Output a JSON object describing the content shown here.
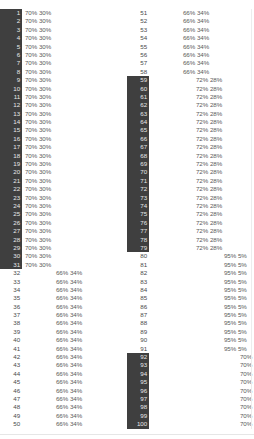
{
  "table": {
    "total_rows": 100,
    "left_pane_label": "rows-1-50",
    "right_pane_label": "rows-51-100",
    "highlight_color": "#3f3f3f",
    "highlight_text_color": "#e8e8e8",
    "text_color": "#5a5a5a",
    "background_color": "#ffffff",
    "columns": [
      "row_number",
      "major_percent",
      "minor_percent"
    ],
    "groups": [
      {
        "name": "group-70-30-a",
        "start": 1,
        "end": 31,
        "major": "70%",
        "minor": "30%",
        "indent": 0,
        "highlighted": true
      },
      {
        "name": "group-66-34-a",
        "start": 32,
        "end": 50,
        "major": "66%",
        "minor": "34%",
        "indent": 1,
        "highlighted": false
      },
      {
        "name": "group-66-34-b",
        "start": 51,
        "end": 58,
        "major": "66%",
        "minor": "34%",
        "indent": 1,
        "highlighted": false
      },
      {
        "name": "group-72-28",
        "start": 59,
        "end": 79,
        "major": "72%",
        "minor": "28%",
        "indent": 2,
        "highlighted": true
      },
      {
        "name": "group-95-5",
        "start": 80,
        "end": 91,
        "major": "95%",
        "minor": "5%",
        "indent": 3,
        "highlighted": false
      },
      {
        "name": "group-70-30-b",
        "start": 92,
        "end": 100,
        "major": "70%",
        "minor": "30%",
        "indent": 4,
        "highlighted": true
      }
    ],
    "rows": [
      {
        "n": 1,
        "major": "70%",
        "minor": "30%",
        "indent": 0,
        "hl": true
      },
      {
        "n": 2,
        "major": "70%",
        "minor": "30%",
        "indent": 0,
        "hl": true
      },
      {
        "n": 3,
        "major": "70%",
        "minor": "30%",
        "indent": 0,
        "hl": true
      },
      {
        "n": 4,
        "major": "70%",
        "minor": "30%",
        "indent": 0,
        "hl": true
      },
      {
        "n": 5,
        "major": "70%",
        "minor": "30%",
        "indent": 0,
        "hl": true
      },
      {
        "n": 6,
        "major": "70%",
        "minor": "30%",
        "indent": 0,
        "hl": true
      },
      {
        "n": 7,
        "major": "70%",
        "minor": "30%",
        "indent": 0,
        "hl": true
      },
      {
        "n": 8,
        "major": "70%",
        "minor": "30%",
        "indent": 0,
        "hl": true
      },
      {
        "n": 9,
        "major": "70%",
        "minor": "30%",
        "indent": 0,
        "hl": true
      },
      {
        "n": 10,
        "major": "70%",
        "minor": "30%",
        "indent": 0,
        "hl": true
      },
      {
        "n": 11,
        "major": "70%",
        "minor": "30%",
        "indent": 0,
        "hl": true
      },
      {
        "n": 12,
        "major": "70%",
        "minor": "30%",
        "indent": 0,
        "hl": true
      },
      {
        "n": 13,
        "major": "70%",
        "minor": "30%",
        "indent": 0,
        "hl": true
      },
      {
        "n": 14,
        "major": "70%",
        "minor": "30%",
        "indent": 0,
        "hl": true
      },
      {
        "n": 15,
        "major": "70%",
        "minor": "30%",
        "indent": 0,
        "hl": true
      },
      {
        "n": 16,
        "major": "70%",
        "minor": "30%",
        "indent": 0,
        "hl": true
      },
      {
        "n": 17,
        "major": "70%",
        "minor": "30%",
        "indent": 0,
        "hl": true
      },
      {
        "n": 18,
        "major": "70%",
        "minor": "30%",
        "indent": 0,
        "hl": true
      },
      {
        "n": 19,
        "major": "70%",
        "minor": "30%",
        "indent": 0,
        "hl": true
      },
      {
        "n": 20,
        "major": "70%",
        "minor": "30%",
        "indent": 0,
        "hl": true
      },
      {
        "n": 21,
        "major": "70%",
        "minor": "30%",
        "indent": 0,
        "hl": true
      },
      {
        "n": 22,
        "major": "70%",
        "minor": "30%",
        "indent": 0,
        "hl": true
      },
      {
        "n": 23,
        "major": "70%",
        "minor": "30%",
        "indent": 0,
        "hl": true
      },
      {
        "n": 24,
        "major": "70%",
        "minor": "30%",
        "indent": 0,
        "hl": true
      },
      {
        "n": 25,
        "major": "70%",
        "minor": "30%",
        "indent": 0,
        "hl": true
      },
      {
        "n": 26,
        "major": "70%",
        "minor": "30%",
        "indent": 0,
        "hl": true
      },
      {
        "n": 27,
        "major": "70%",
        "minor": "30%",
        "indent": 0,
        "hl": true
      },
      {
        "n": 28,
        "major": "70%",
        "minor": "30%",
        "indent": 0,
        "hl": true
      },
      {
        "n": 29,
        "major": "70%",
        "minor": "30%",
        "indent": 0,
        "hl": true
      },
      {
        "n": 30,
        "major": "70%",
        "minor": "30%",
        "indent": 0,
        "hl": true
      },
      {
        "n": 31,
        "major": "70%",
        "minor": "30%",
        "indent": 0,
        "hl": true
      },
      {
        "n": 32,
        "major": "66%",
        "minor": "34%",
        "indent": 1,
        "hl": false
      },
      {
        "n": 33,
        "major": "66%",
        "minor": "34%",
        "indent": 1,
        "hl": false
      },
      {
        "n": 34,
        "major": "66%",
        "minor": "34%",
        "indent": 1,
        "hl": false
      },
      {
        "n": 35,
        "major": "66%",
        "minor": "34%",
        "indent": 1,
        "hl": false
      },
      {
        "n": 36,
        "major": "66%",
        "minor": "34%",
        "indent": 1,
        "hl": false
      },
      {
        "n": 37,
        "major": "66%",
        "minor": "34%",
        "indent": 1,
        "hl": false
      },
      {
        "n": 38,
        "major": "66%",
        "minor": "34%",
        "indent": 1,
        "hl": false
      },
      {
        "n": 39,
        "major": "66%",
        "minor": "34%",
        "indent": 1,
        "hl": false
      },
      {
        "n": 40,
        "major": "66%",
        "minor": "34%",
        "indent": 1,
        "hl": false
      },
      {
        "n": 41,
        "major": "66%",
        "minor": "34%",
        "indent": 1,
        "hl": false
      },
      {
        "n": 42,
        "major": "66%",
        "minor": "34%",
        "indent": 1,
        "hl": false
      },
      {
        "n": 43,
        "major": "66%",
        "minor": "34%",
        "indent": 1,
        "hl": false
      },
      {
        "n": 44,
        "major": "66%",
        "minor": "34%",
        "indent": 1,
        "hl": false
      },
      {
        "n": 45,
        "major": "66%",
        "minor": "34%",
        "indent": 1,
        "hl": false
      },
      {
        "n": 46,
        "major": "66%",
        "minor": "34%",
        "indent": 1,
        "hl": false
      },
      {
        "n": 47,
        "major": "66%",
        "minor": "34%",
        "indent": 1,
        "hl": false
      },
      {
        "n": 48,
        "major": "66%",
        "minor": "34%",
        "indent": 1,
        "hl": false
      },
      {
        "n": 49,
        "major": "66%",
        "minor": "34%",
        "indent": 1,
        "hl": false
      },
      {
        "n": 50,
        "major": "66%",
        "minor": "34%",
        "indent": 1,
        "hl": false
      },
      {
        "n": 51,
        "major": "66%",
        "minor": "34%",
        "indent": 1,
        "hl": false
      },
      {
        "n": 52,
        "major": "66%",
        "minor": "34%",
        "indent": 1,
        "hl": false
      },
      {
        "n": 53,
        "major": "66%",
        "minor": "34%",
        "indent": 1,
        "hl": false
      },
      {
        "n": 54,
        "major": "66%",
        "minor": "34%",
        "indent": 1,
        "hl": false
      },
      {
        "n": 55,
        "major": "66%",
        "minor": "34%",
        "indent": 1,
        "hl": false
      },
      {
        "n": 56,
        "major": "66%",
        "minor": "34%",
        "indent": 1,
        "hl": false
      },
      {
        "n": 57,
        "major": "66%",
        "minor": "34%",
        "indent": 1,
        "hl": false
      },
      {
        "n": 58,
        "major": "66%",
        "minor": "34%",
        "indent": 1,
        "hl": false
      },
      {
        "n": 59,
        "major": "72%",
        "minor": "28%",
        "indent": 2,
        "hl": true
      },
      {
        "n": 60,
        "major": "72%",
        "minor": "28%",
        "indent": 2,
        "hl": true
      },
      {
        "n": 61,
        "major": "72%",
        "minor": "28%",
        "indent": 2,
        "hl": true
      },
      {
        "n": 62,
        "major": "72%",
        "minor": "28%",
        "indent": 2,
        "hl": true
      },
      {
        "n": 63,
        "major": "72%",
        "minor": "28%",
        "indent": 2,
        "hl": true
      },
      {
        "n": 64,
        "major": "72%",
        "minor": "28%",
        "indent": 2,
        "hl": true
      },
      {
        "n": 65,
        "major": "72%",
        "minor": "28%",
        "indent": 2,
        "hl": true
      },
      {
        "n": 66,
        "major": "72%",
        "minor": "28%",
        "indent": 2,
        "hl": true
      },
      {
        "n": 67,
        "major": "72%",
        "minor": "28%",
        "indent": 2,
        "hl": true
      },
      {
        "n": 68,
        "major": "72%",
        "minor": "28%",
        "indent": 2,
        "hl": true
      },
      {
        "n": 69,
        "major": "72%",
        "minor": "28%",
        "indent": 2,
        "hl": true
      },
      {
        "n": 70,
        "major": "72%",
        "minor": "28%",
        "indent": 2,
        "hl": true
      },
      {
        "n": 71,
        "major": "72%",
        "minor": "28%",
        "indent": 2,
        "hl": true
      },
      {
        "n": 72,
        "major": "72%",
        "minor": "28%",
        "indent": 2,
        "hl": true
      },
      {
        "n": 73,
        "major": "72%",
        "minor": "28%",
        "indent": 2,
        "hl": true
      },
      {
        "n": 74,
        "major": "72%",
        "minor": "28%",
        "indent": 2,
        "hl": true
      },
      {
        "n": 75,
        "major": "72%",
        "minor": "28%",
        "indent": 2,
        "hl": true
      },
      {
        "n": 76,
        "major": "72%",
        "minor": "28%",
        "indent": 2,
        "hl": true
      },
      {
        "n": 77,
        "major": "72%",
        "minor": "28%",
        "indent": 2,
        "hl": true
      },
      {
        "n": 78,
        "major": "72%",
        "minor": "28%",
        "indent": 2,
        "hl": true
      },
      {
        "n": 79,
        "major": "72%",
        "minor": "28%",
        "indent": 2,
        "hl": true
      },
      {
        "n": 80,
        "major": "95%",
        "minor": "5%",
        "indent": 3,
        "hl": false
      },
      {
        "n": 81,
        "major": "95%",
        "minor": "5%",
        "indent": 3,
        "hl": false
      },
      {
        "n": 82,
        "major": "95%",
        "minor": "5%",
        "indent": 3,
        "hl": false
      },
      {
        "n": 83,
        "major": "95%",
        "minor": "5%",
        "indent": 3,
        "hl": false
      },
      {
        "n": 84,
        "major": "95%",
        "minor": "5%",
        "indent": 3,
        "hl": false
      },
      {
        "n": 85,
        "major": "95%",
        "minor": "5%",
        "indent": 3,
        "hl": false
      },
      {
        "n": 86,
        "major": "95%",
        "minor": "5%",
        "indent": 3,
        "hl": false
      },
      {
        "n": 87,
        "major": "95%",
        "minor": "5%",
        "indent": 3,
        "hl": false
      },
      {
        "n": 88,
        "major": "95%",
        "minor": "5%",
        "indent": 3,
        "hl": false
      },
      {
        "n": 89,
        "major": "95%",
        "minor": "5%",
        "indent": 3,
        "hl": false
      },
      {
        "n": 90,
        "major": "95%",
        "minor": "5%",
        "indent": 3,
        "hl": false
      },
      {
        "n": 91,
        "major": "95%",
        "minor": "5%",
        "indent": 3,
        "hl": false
      },
      {
        "n": 92,
        "major": "70%",
        "minor": "30%",
        "indent": 4,
        "hl": true
      },
      {
        "n": 93,
        "major": "70%",
        "minor": "30%",
        "indent": 4,
        "hl": true
      },
      {
        "n": 94,
        "major": "70%",
        "minor": "30%",
        "indent": 4,
        "hl": true
      },
      {
        "n": 95,
        "major": "70%",
        "minor": "30%",
        "indent": 4,
        "hl": true
      },
      {
        "n": 96,
        "major": "70%",
        "minor": "30%",
        "indent": 4,
        "hl": true
      },
      {
        "n": 97,
        "major": "70%",
        "minor": "30%",
        "indent": 4,
        "hl": true
      },
      {
        "n": 98,
        "major": "70%",
        "minor": "30%",
        "indent": 4,
        "hl": true
      },
      {
        "n": 99,
        "major": "70%",
        "minor": "30%",
        "indent": 4,
        "hl": true
      },
      {
        "n": 100,
        "major": "70%",
        "minor": "30%",
        "indent": 4,
        "hl": true
      }
    ]
  }
}
